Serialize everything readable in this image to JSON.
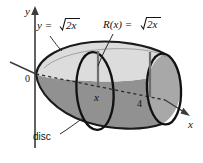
{
  "figure": {
    "background_color": "#ffffff",
    "width": 203,
    "height": 163
  },
  "axes": {
    "x_axis_label": "x",
    "y_axis_label": "y",
    "origin_label": "0",
    "x_tick_label": "4",
    "x_variable_label": "x"
  },
  "labels": {
    "curve_equation": "y = √2x",
    "curve_equation_prefix": "y =",
    "radius_equation": "R(x) = √2x",
    "radius_equation_prefix": "R(x) =",
    "radicand": "2x",
    "disc_callout": "disc"
  },
  "colors": {
    "outline": "#1a1a1a",
    "top_surface": "#dcdcdc",
    "front_body": "#919191",
    "end_cap": "#a8a8a8",
    "axis": "#4a4a4a",
    "radius_line": "#6e6e6e",
    "text": "#111111"
  },
  "geometry": {
    "curve_function": "y = sqrt(2x)",
    "revolution_axis": "x-axis",
    "x_interval": [
      0,
      4
    ],
    "disc_positions": [
      "x",
      "4"
    ],
    "radius_at_x": "sqrt(2x)"
  }
}
